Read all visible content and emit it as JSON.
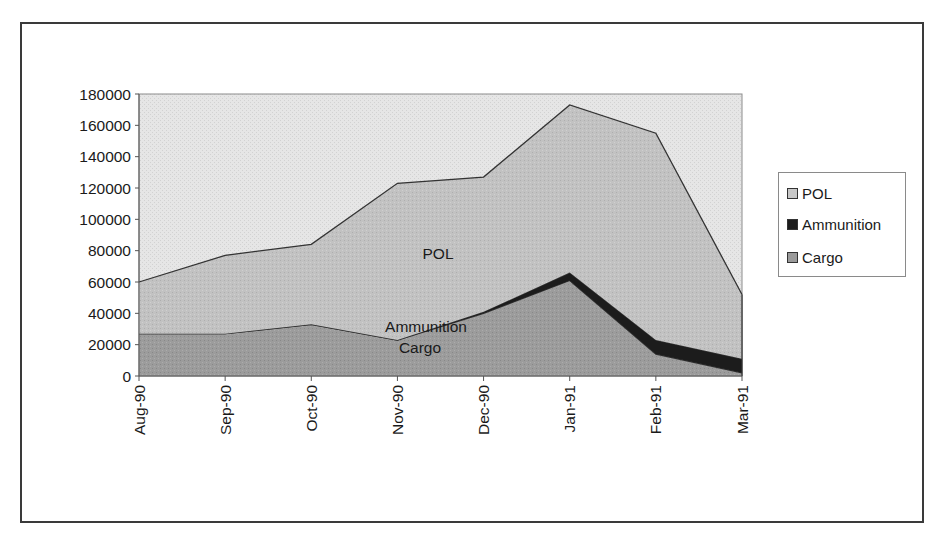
{
  "chart_data": {
    "type": "area",
    "stacked": true,
    "title": "",
    "xlabel": "",
    "ylabel": "",
    "categories": [
      "Aug-90",
      "Sep-90",
      "Oct-90",
      "Nov-90",
      "Dec-90",
      "Jan-91",
      "Feb-91",
      "Mar-91"
    ],
    "series": [
      {
        "name": "Cargo",
        "values": [
          27000,
          27000,
          33000,
          23000,
          40000,
          61000,
          14000,
          2000
        ],
        "color": "#9a9a9a"
      },
      {
        "name": "Ammunition",
        "values": [
          0,
          0,
          0,
          0,
          1000,
          5000,
          9000,
          9000
        ],
        "color": "#1c1c1c"
      },
      {
        "name": "POL",
        "values": [
          33000,
          50000,
          51000,
          100000,
          86000,
          107000,
          132000,
          41000
        ],
        "color": "#c4c4c4"
      }
    ],
    "stack_totals": [
      60000,
      77000,
      84000,
      123000,
      127000,
      173000,
      155000,
      52000
    ],
    "ylim": [
      0,
      180000
    ],
    "yticks": [
      "0",
      "20000",
      "40000",
      "60000",
      "80000",
      "100000",
      "120000",
      "140000",
      "160000",
      "180000"
    ],
    "grid": false,
    "plot_background": "#e8e8e8",
    "legend": {
      "position": "right",
      "entries": [
        "POL",
        "Ammunition",
        "Cargo"
      ]
    },
    "annotations": [
      {
        "text": "POL",
        "category": "Nov-90",
        "value": 78000
      },
      {
        "text": "Ammunition",
        "category": "Dec-90",
        "value": 30000
      },
      {
        "text": "Cargo",
        "category": "Dec-90",
        "value": 16000
      }
    ]
  }
}
